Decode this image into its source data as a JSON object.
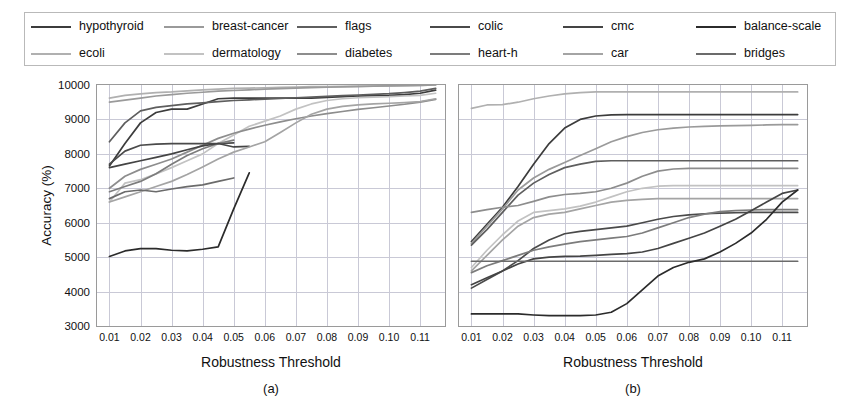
{
  "figure": {
    "legend_position": "top",
    "grid": true,
    "panel_count": 2
  },
  "legend": {
    "entries": [
      {
        "label": "hypothyroid",
        "color": "#3c3c3c"
      },
      {
        "label": "breast-cancer",
        "color": "#9a9a9a"
      },
      {
        "label": "flags",
        "color": "#5e5e5e"
      },
      {
        "label": "colic",
        "color": "#4a4a4a"
      },
      {
        "label": "cmc",
        "color": "#444444"
      },
      {
        "label": "balance-scale",
        "color": "#2b2b2b"
      },
      {
        "label": "ecoli",
        "color": "#b0b0b0"
      },
      {
        "label": "dermatology",
        "color": "#c2c2c2"
      },
      {
        "label": "diabetes",
        "color": "#8d8d8d"
      },
      {
        "label": "heart-h",
        "color": "#7c7c7c"
      },
      {
        "label": "car",
        "color": "#a4a4a4"
      },
      {
        "label": "bridges",
        "color": "#6b6b6b"
      }
    ]
  },
  "panels": [
    {
      "id": "a",
      "caption": "(a)",
      "xlabel": "Robustness Threshold",
      "ylabel": "Accuracy (%)",
      "show_yticks": true,
      "yticks": [
        3000,
        4000,
        5000,
        6000,
        7000,
        8000,
        9000,
        10000
      ],
      "xticks": [
        0.01,
        0.02,
        0.03,
        0.04,
        0.05,
        0.06,
        0.07,
        0.08,
        0.09,
        0.1,
        0.11
      ],
      "xtick_labels": [
        "0.01",
        "0.02",
        "0.03",
        "0.04",
        "0.05",
        "0.06",
        "0.07",
        "0.08",
        "0.09",
        "0.10",
        "0.11"
      ]
    },
    {
      "id": "b",
      "caption": "(b)",
      "xlabel": "Robustness Threshold",
      "ylabel": "",
      "show_yticks": false,
      "yticks": [
        3000,
        4000,
        5000,
        6000,
        7000,
        8000,
        9000,
        10000
      ],
      "xticks": [
        0.01,
        0.02,
        0.03,
        0.04,
        0.05,
        0.06,
        0.07,
        0.08,
        0.09,
        0.1,
        0.11
      ],
      "xtick_labels": [
        "0.01",
        "0.02",
        "0.03",
        "0.04",
        "0.05",
        "0.06",
        "0.07",
        "0.08",
        "0.09",
        "0.10",
        "0.11"
      ]
    }
  ],
  "chart_data": [
    {
      "type": "line",
      "panel": "a",
      "title": "(a)",
      "xlabel": "Robustness Threshold",
      "ylabel": "Accuracy (%)",
      "xlim": [
        0.006,
        0.118
      ],
      "ylim": [
        3000,
        10000
      ],
      "grid": true,
      "legend_position": "top",
      "x": [
        0.01,
        0.015,
        0.02,
        0.025,
        0.03,
        0.035,
        0.04,
        0.045,
        0.05,
        0.055,
        0.06,
        0.065,
        0.07,
        0.075,
        0.08,
        0.085,
        0.09,
        0.095,
        0.1,
        0.105,
        0.11,
        0.115
      ],
      "series": [
        {
          "name": "hypothyroid",
          "color": "#3c3c3c",
          "values": [
            7650,
            8300,
            8900,
            9200,
            9300,
            9300,
            9450,
            9600,
            9620,
            9620,
            9620,
            9620,
            9620,
            9620,
            9640,
            9660,
            9680,
            9690,
            9700,
            9720,
            9760,
            9850
          ]
        },
        {
          "name": "ecoli",
          "color": "#b0b0b0",
          "values": [
            9620,
            9700,
            9740,
            9780,
            9800,
            9830,
            9860,
            9880,
            9900,
            9910,
            9920,
            9930,
            9940,
            9950,
            9955,
            9960,
            9965,
            9970,
            9975,
            9980,
            9990,
            10000
          ]
        },
        {
          "name": "breast-cancer",
          "color": "#9a9a9a",
          "values": [
            9500,
            9560,
            9620,
            9680,
            9720,
            9760,
            9790,
            9820,
            9840,
            9860,
            9880,
            9895,
            9910,
            9925,
            9935,
            9945,
            9955,
            9965,
            9972,
            9980,
            9990,
            10000
          ]
        },
        {
          "name": "dermatology",
          "color": "#c2c2c2",
          "values": [
            6600,
            7150,
            7250,
            7420,
            7600,
            7800,
            8000,
            8300,
            8550,
            8800,
            8950,
            9100,
            9300,
            9450,
            9550,
            9600,
            9630,
            9650,
            9660,
            9680,
            9700,
            9760
          ]
        },
        {
          "name": "flags",
          "color": "#5e5e5e",
          "values": [
            8350,
            8900,
            9250,
            9350,
            9400,
            9450,
            9480,
            9520,
            9550,
            9570,
            9590,
            9610,
            9630,
            9650,
            9670,
            9690,
            9710,
            9730,
            9750,
            9780,
            9820,
            9900
          ]
        },
        {
          "name": "diabetes",
          "color": "#8d8d8d",
          "values": [
            7000,
            7350,
            7550,
            7700,
            7850,
            8050,
            8250,
            8450,
            8600,
            8720,
            8830,
            8930,
            9020,
            9100,
            9170,
            9230,
            9290,
            9340,
            9390,
            9440,
            9500,
            9580
          ]
        },
        {
          "name": "colic",
          "color": "#4a4a4a",
          "values": [
            7700,
            8080,
            8250,
            8280,
            8300,
            8300,
            8300,
            8300,
            8320,
            null,
            null,
            null,
            null,
            null,
            null,
            null,
            null,
            null,
            null,
            null,
            null,
            null
          ]
        },
        {
          "name": "heart-h",
          "color": "#7c7c7c",
          "values": [
            6900,
            7050,
            7200,
            7420,
            7700,
            7950,
            8150,
            8300,
            8400,
            null,
            null,
            null,
            null,
            null,
            null,
            null,
            null,
            null,
            null,
            null,
            null,
            null
          ]
        },
        {
          "name": "cmc",
          "color": "#444444",
          "values": [
            7600,
            7700,
            7800,
            7900,
            8000,
            8120,
            8230,
            8300,
            8200,
            8220,
            null,
            null,
            null,
            null,
            null,
            null,
            null,
            null,
            null,
            null,
            null,
            null
          ]
        },
        {
          "name": "car",
          "color": "#a4a4a4",
          "values": [
            6600,
            6750,
            6900,
            7050,
            7200,
            7400,
            7620,
            7850,
            8050,
            8200,
            8350,
            8620,
            8900,
            9150,
            9300,
            9380,
            9420,
            9450,
            9470,
            9490,
            9520,
            9600
          ]
        },
        {
          "name": "bridges",
          "color": "#6b6b6b",
          "values": [
            6700,
            6900,
            6950,
            6900,
            6980,
            7050,
            7100,
            7200,
            7300,
            null,
            null,
            null,
            null,
            null,
            null,
            null,
            null,
            null,
            null,
            null,
            null,
            null
          ]
        },
        {
          "name": "balance-scale",
          "color": "#2b2b2b",
          "values": [
            5020,
            5180,
            5250,
            5250,
            5200,
            5180,
            5230,
            5300,
            6400,
            7450,
            null,
            null,
            null,
            null,
            null,
            null,
            null,
            null,
            null,
            null,
            null,
            null
          ]
        }
      ]
    },
    {
      "type": "line",
      "panel": "b",
      "title": "(b)",
      "xlabel": "Robustness Threshold",
      "ylabel": "Accuracy (%)",
      "xlim": [
        0.006,
        0.118
      ],
      "ylim": [
        3000,
        10000
      ],
      "grid": true,
      "legend_position": "top",
      "x": [
        0.01,
        0.015,
        0.02,
        0.025,
        0.03,
        0.035,
        0.04,
        0.045,
        0.05,
        0.055,
        0.06,
        0.065,
        0.07,
        0.075,
        0.08,
        0.085,
        0.09,
        0.095,
        0.1,
        0.105,
        0.11,
        0.115
      ],
      "series": [
        {
          "name": "ecoli",
          "color": "#b0b0b0",
          "values": [
            9320,
            9420,
            9430,
            9500,
            9600,
            9680,
            9740,
            9780,
            9800,
            9800,
            9800,
            9800,
            9800,
            9800,
            9800,
            9800,
            9800,
            9800,
            9800,
            9800,
            9800,
            9800
          ]
        },
        {
          "name": "hypothyroid",
          "color": "#3c3c3c",
          "values": [
            5450,
            5950,
            6450,
            7050,
            7700,
            8300,
            8750,
            9000,
            9100,
            9130,
            9140,
            9140,
            9140,
            9140,
            9140,
            9140,
            9140,
            9140,
            9140,
            9140,
            9140,
            9140
          ]
        },
        {
          "name": "breast-cancer",
          "color": "#9a9a9a",
          "values": [
            5400,
            5900,
            6400,
            6950,
            7300,
            7550,
            7750,
            7950,
            8150,
            8350,
            8500,
            8620,
            8700,
            8750,
            8780,
            8800,
            8810,
            8820,
            8830,
            8840,
            8850,
            8850
          ]
        },
        {
          "name": "flags",
          "color": "#5e5e5e",
          "values": [
            5350,
            5800,
            6300,
            6800,
            7150,
            7400,
            7600,
            7700,
            7780,
            7800,
            7800,
            7800,
            7800,
            7800,
            7800,
            7800,
            7800,
            7800,
            7800,
            7800,
            7800,
            7800
          ]
        },
        {
          "name": "diabetes",
          "color": "#8d8d8d",
          "values": [
            6300,
            6380,
            6450,
            6500,
            6620,
            6750,
            6820,
            6850,
            6900,
            7000,
            7150,
            7350,
            7500,
            7560,
            7580,
            7580,
            7580,
            7580,
            7580,
            7580,
            7580,
            7580
          ]
        },
        {
          "name": "dermatology",
          "color": "#c2c2c2",
          "values": [
            4700,
            5200,
            5650,
            6050,
            6300,
            6350,
            6400,
            6480,
            6600,
            6750,
            6900,
            7000,
            7060,
            7080,
            7080,
            7080,
            7080,
            7080,
            7080,
            7080,
            7080,
            7080
          ]
        },
        {
          "name": "car",
          "color": "#a4a4a4",
          "values": [
            4600,
            5050,
            5500,
            5900,
            6150,
            6250,
            6300,
            6400,
            6500,
            6600,
            6650,
            6680,
            6700,
            6700,
            6700,
            6700,
            6700,
            6700,
            6700,
            6700,
            6700,
            6700
          ]
        },
        {
          "name": "colic",
          "color": "#4a4a4a",
          "values": [
            4100,
            4350,
            4600,
            4900,
            5250,
            5500,
            5680,
            5750,
            5800,
            5850,
            5900,
            6000,
            6100,
            6180,
            6230,
            6260,
            6280,
            6290,
            6300,
            6300,
            6300,
            6300
          ]
        },
        {
          "name": "heart-h",
          "color": "#7c7c7c",
          "values": [
            4550,
            4750,
            4900,
            5050,
            5200,
            5300,
            5380,
            5450,
            5500,
            5550,
            5600,
            5700,
            5850,
            6000,
            6150,
            6250,
            6320,
            6350,
            6370,
            6380,
            6380,
            6380
          ]
        },
        {
          "name": "cmc",
          "color": "#444444",
          "values": [
            4200,
            4400,
            4600,
            4800,
            4950,
            5000,
            5020,
            5030,
            5050,
            5080,
            5100,
            5150,
            5250,
            5400,
            5550,
            5700,
            5900,
            6100,
            6350,
            6600,
            6850,
            6950
          ]
        },
        {
          "name": "bridges",
          "color": "#6b6b6b",
          "values": [
            4880,
            4880,
            4880,
            4880,
            4880,
            4880,
            4880,
            4880,
            4880,
            4880,
            4880,
            4880,
            4880,
            4880,
            4880,
            4880,
            4880,
            4880,
            4880,
            4880,
            4880,
            4880
          ]
        },
        {
          "name": "balance-scale",
          "color": "#2b2b2b",
          "values": [
            3350,
            3350,
            3350,
            3350,
            3320,
            3300,
            3300,
            3300,
            3320,
            3400,
            3650,
            4050,
            4450,
            4700,
            4850,
            4950,
            5150,
            5400,
            5700,
            6100,
            6600,
            6950
          ]
        }
      ]
    }
  ]
}
